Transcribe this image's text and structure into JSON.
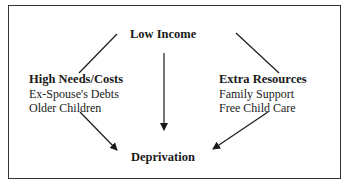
{
  "diagram": {
    "top": {
      "label": "Low Income"
    },
    "left": {
      "label": "High Needs/Costs",
      "items": [
        "Ex-Spouse's Debts",
        "Older Children"
      ]
    },
    "right": {
      "label": "Extra Resources",
      "items": [
        "Family Support",
        "Free Child Care"
      ]
    },
    "bottom": {
      "label": "Deprivation"
    },
    "edges": [
      {
        "from": "Low Income",
        "to": "High Needs/Costs",
        "arrow": false
      },
      {
        "from": "Low Income",
        "to": "Extra Resources",
        "arrow": false
      },
      {
        "from": "Low Income",
        "to": "Deprivation",
        "arrow": true
      },
      {
        "from": "High Needs/Costs",
        "to": "Deprivation",
        "arrow": true
      },
      {
        "from": "Extra Resources",
        "to": "Deprivation",
        "arrow": true
      }
    ]
  }
}
